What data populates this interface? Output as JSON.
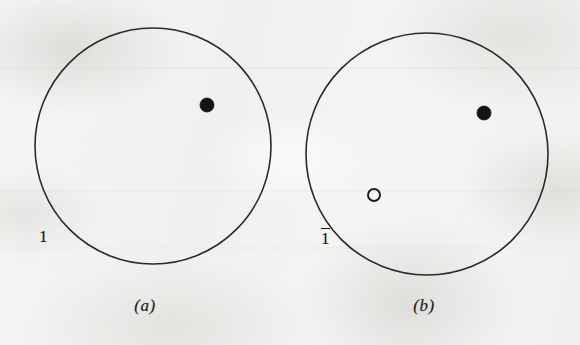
{
  "figure": {
    "kind": "mathematical-diagram",
    "background_color": "#f1f0ee",
    "ink_color": "#1c1c1c",
    "width": 580,
    "height": 345,
    "panels": [
      {
        "id": "a",
        "caption": "(a)",
        "caption_x": 145,
        "caption_y": 296,
        "circle": {
          "cx": 153,
          "cy": 146,
          "r": 118,
          "stroke": "#2a2a2a",
          "stroke_width": 1.6,
          "fill": "none"
        },
        "label": {
          "text": "1",
          "overbar": false,
          "x": 39,
          "y": 228
        },
        "points": [
          {
            "name": "filled-point",
            "style": "filled",
            "cx": 207,
            "cy": 105,
            "r": 7,
            "fill": "#141414",
            "stroke": "#141414"
          }
        ]
      },
      {
        "id": "b",
        "caption": "(b)",
        "caption_x": 424,
        "caption_y": 296,
        "circle": {
          "cx": 427,
          "cy": 154,
          "r": 121,
          "stroke": "#2a2a2a",
          "stroke_width": 1.6,
          "fill": "none"
        },
        "label": {
          "text": "1",
          "overbar": true,
          "x": 321,
          "y": 228
        },
        "points": [
          {
            "name": "filled-point",
            "style": "filled",
            "cx": 484,
            "cy": 113,
            "r": 7,
            "fill": "#141414",
            "stroke": "#141414"
          },
          {
            "name": "open-point",
            "style": "open",
            "cx": 374,
            "cy": 195,
            "r": 6,
            "fill": "none",
            "stroke": "#1a1a1a"
          }
        ]
      }
    ]
  }
}
